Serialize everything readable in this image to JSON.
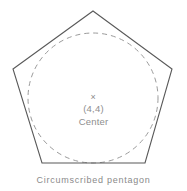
{
  "figure": {
    "caption": "Circumscribed pentagon",
    "center_marker": "×",
    "center_coordinates": "(4,4)",
    "center_label": "Center",
    "shape_name": "pentagon",
    "inner_shape_name": "circle",
    "colors": {
      "background": "#ffffff",
      "pentagon_stroke": "#595959",
      "circle_stroke": "#9a9a9a",
      "text": "#8a8a8a"
    }
  },
  "chart_data": {
    "type": "diagram",
    "title": "Circumscribed pentagon",
    "center": {
      "x": 4,
      "y": 4,
      "label": "Center",
      "marker": "×"
    },
    "shapes": [
      {
        "name": "pentagon",
        "style": "solid",
        "stroke": "#595959",
        "fill": "none",
        "stroke_width": 1,
        "vertices": [
          {
            "x": 93,
            "y": 11
          },
          {
            "x": 172,
            "y": 69
          },
          {
            "x": 145,
            "y": 163
          },
          {
            "x": 42,
            "y": 163
          },
          {
            "x": 13,
            "y": 69
          }
        ]
      },
      {
        "name": "inscribed-circle",
        "style": "dashed",
        "stroke": "#9a9a9a",
        "fill": "none",
        "stroke_width": 1,
        "center": {
          "x": 93,
          "y": 98
        },
        "radius": 65
      }
    ],
    "center_pixel": {
      "x": 93,
      "y": 99
    },
    "grid": false,
    "legend": false
  }
}
